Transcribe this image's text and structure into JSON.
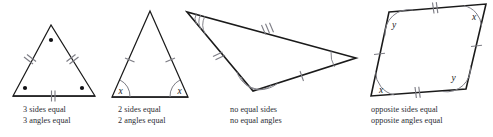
{
  "figure": {
    "title_text": "",
    "stroke_color": "#1a1a1a",
    "mark_color": "#7d7d85",
    "label_color": "#1a1a1a",
    "caption_color": "#2b2b33",
    "shapes": [
      {
        "name": "equilateral-triangle",
        "kind": "triangle",
        "vertices": [
          [
            51,
            25
          ],
          [
            13,
            96
          ],
          [
            95,
            96
          ]
        ],
        "side_ticks": [
          2,
          2,
          2
        ],
        "angle_marks": "dots",
        "angle_labels": [],
        "caption_lines": [
          "3 sides equal",
          "3 angles equal"
        ]
      },
      {
        "name": "isosceles-triangle",
        "kind": "triangle",
        "vertices": [
          [
            150,
            11
          ],
          [
            112,
            97
          ],
          [
            188,
            97
          ]
        ],
        "side_ticks": [
          1,
          0,
          1
        ],
        "angle_marks": "arcs",
        "angle_labels": [
          "x",
          "x"
        ],
        "caption_lines": [
          "2 sides equal",
          "2 angles equal"
        ]
      },
      {
        "name": "scalene-triangle",
        "kind": "triangle",
        "vertices": [
          [
            187,
            12
          ],
          [
            253,
            91
          ],
          [
            356,
            58
          ]
        ],
        "side_ticks": [
          2,
          1,
          3
        ],
        "angle_marks": "arcs",
        "angle_labels": [],
        "arc_counts": [
          3,
          2,
          1
        ],
        "caption_lines": [
          "no equal sides",
          "no equal angles"
        ]
      },
      {
        "name": "parallelogram",
        "kind": "quadrilateral",
        "vertices": [
          [
            389,
            12
          ],
          [
            486,
            4
          ],
          [
            466,
            89
          ],
          [
            371,
            96
          ]
        ],
        "side_ticks": [
          2,
          1,
          2,
          1
        ],
        "angle_marks": "arcs",
        "angle_labels": [
          "y",
          "x",
          "y",
          "x"
        ],
        "caption_lines": [
          "opposite sides equal",
          "opposite angles equal"
        ]
      }
    ]
  },
  "captions": {
    "shape1": {
      "line1": "3 sides equal",
      "line2": "3 angles equal"
    },
    "shape2": {
      "line1": "2 sides equal",
      "line2": "2 angles equal"
    },
    "shape3": {
      "line1": "no equal sides",
      "line2": "no equal angles"
    },
    "shape4": {
      "line1": "opposite sides equal",
      "line2": "opposite angles equal"
    }
  },
  "angle_labels": {
    "iso_left": "x",
    "iso_right": "x",
    "para_top_left": "y",
    "para_top_right": "x",
    "para_bottom_right": "y",
    "para_bottom_left": "x"
  }
}
